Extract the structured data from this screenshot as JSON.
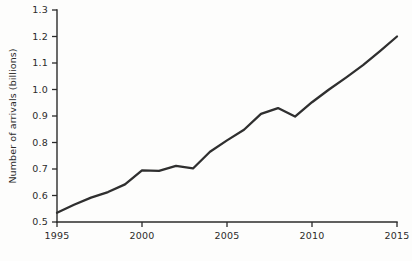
{
  "chart_data": {
    "type": "line",
    "title": "",
    "subtitle": "",
    "xlabel": "",
    "ylabel": "Number of arrivals (billions)",
    "xlim": [
      1995,
      2015
    ],
    "ylim": [
      0.5,
      1.3
    ],
    "grid": false,
    "legend": "none",
    "x_ticks": [
      "1995",
      "2000",
      "2005",
      "2010",
      "2015"
    ],
    "x_tick_values": [
      1995,
      2000,
      2005,
      2010,
      2015
    ],
    "y_ticks": [
      "0.5",
      "0.6",
      "0.7",
      "0.8",
      "0.9",
      "1.0",
      "1.1",
      "1.2",
      "1.3"
    ],
    "y_tick_values": [
      0.5,
      0.6,
      0.7,
      0.8,
      0.9,
      1.0,
      1.1,
      1.2,
      1.3
    ],
    "x": [
      1995,
      1996,
      1997,
      1998,
      1999,
      2000,
      2001,
      2002,
      2003,
      2004,
      2005,
      2006,
      2007,
      2008,
      2009,
      2010,
      2011,
      2012,
      2013,
      2014,
      2015
    ],
    "series": [
      {
        "name": "International tourist arrivals",
        "values": [
          0.535,
          0.565,
          0.592,
          0.613,
          0.642,
          0.695,
          0.693,
          0.712,
          0.702,
          0.765,
          0.808,
          0.848,
          0.908,
          0.93,
          0.898,
          0.952,
          1.0,
          1.045,
          1.092,
          1.145,
          1.2
        ],
        "color": "#2f2f2f"
      }
    ],
    "annotations": []
  },
  "axis_color": "#2b2b2b",
  "background_color": "#fdfdfc"
}
